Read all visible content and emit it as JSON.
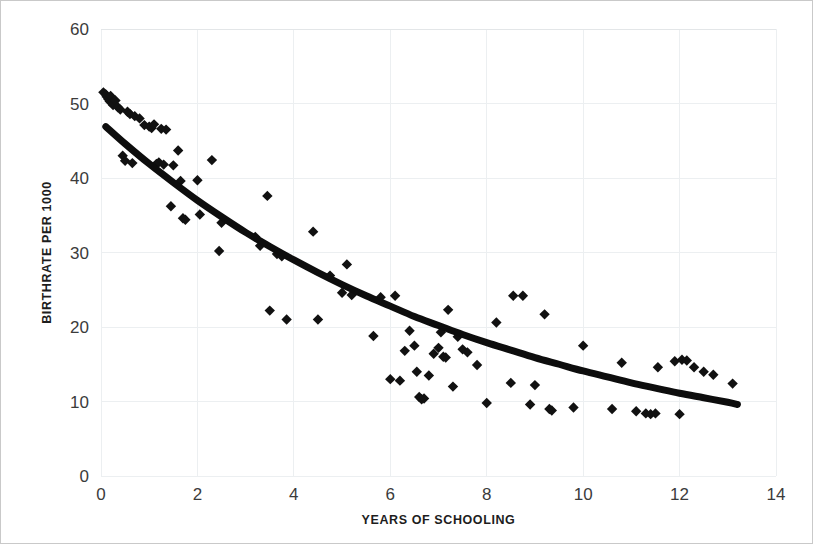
{
  "chart_data": {
    "type": "scatter",
    "title": "",
    "xlabel": "YEARS OF SCHOOLING",
    "ylabel": "BIRTHRATE PER 1000",
    "xlim": [
      0,
      14
    ],
    "ylim": [
      0,
      60
    ],
    "xticks": [
      0,
      2,
      4,
      6,
      8,
      10,
      12,
      14
    ],
    "yticks": [
      0,
      10,
      20,
      30,
      40,
      50,
      60
    ],
    "xtick_labels": [
      "0",
      "2",
      "4",
      "6",
      "8",
      "10",
      "12",
      "14"
    ],
    "ytick_labels": [
      "0",
      "10",
      "20",
      "30",
      "40",
      "50",
      "60"
    ],
    "grid": true,
    "legend": "none",
    "marker_shape": "diamond",
    "marker_color": "#111111",
    "series": [
      {
        "name": "Countries",
        "type": "scatter",
        "points": [
          [
            0.05,
            51.5
          ],
          [
            0.1,
            51.2
          ],
          [
            0.12,
            50.9
          ],
          [
            0.15,
            50.6
          ],
          [
            0.18,
            50.3
          ],
          [
            0.2,
            51.0
          ],
          [
            0.22,
            50.1
          ],
          [
            0.25,
            49.8
          ],
          [
            0.3,
            50.4
          ],
          [
            0.35,
            49.5
          ],
          [
            0.4,
            49.2
          ],
          [
            0.45,
            43.0
          ],
          [
            0.5,
            42.3
          ],
          [
            0.55,
            48.9
          ],
          [
            0.6,
            48.6
          ],
          [
            0.65,
            42.0
          ],
          [
            0.7,
            48.3
          ],
          [
            0.8,
            48.0
          ],
          [
            0.9,
            47.1
          ],
          [
            1.0,
            46.9
          ],
          [
            1.05,
            46.7
          ],
          [
            1.1,
            47.2
          ],
          [
            1.15,
            41.9
          ],
          [
            1.2,
            42.1
          ],
          [
            1.25,
            46.6
          ],
          [
            1.3,
            41.8
          ],
          [
            1.35,
            46.5
          ],
          [
            1.45,
            36.2
          ],
          [
            1.5,
            41.7
          ],
          [
            1.6,
            43.7
          ],
          [
            1.65,
            39.6
          ],
          [
            1.7,
            34.6
          ],
          [
            1.75,
            34.4
          ],
          [
            2.0,
            39.7
          ],
          [
            2.05,
            35.1
          ],
          [
            2.3,
            42.4
          ],
          [
            2.45,
            30.2
          ],
          [
            2.5,
            34.0
          ],
          [
            3.2,
            32.1
          ],
          [
            3.3,
            30.9
          ],
          [
            3.45,
            37.6
          ],
          [
            3.5,
            22.2
          ],
          [
            3.65,
            29.8
          ],
          [
            3.75,
            29.5
          ],
          [
            3.85,
            21.0
          ],
          [
            4.4,
            32.8
          ],
          [
            4.5,
            21.0
          ],
          [
            4.75,
            26.9
          ],
          [
            5.0,
            24.6
          ],
          [
            5.1,
            28.4
          ],
          [
            5.2,
            24.3
          ],
          [
            5.65,
            18.8
          ],
          [
            5.8,
            24.0
          ],
          [
            6.0,
            13.0
          ],
          [
            6.1,
            24.2
          ],
          [
            6.2,
            12.8
          ],
          [
            6.3,
            16.8
          ],
          [
            6.4,
            19.5
          ],
          [
            6.5,
            17.5
          ],
          [
            6.55,
            14.0
          ],
          [
            6.6,
            10.6
          ],
          [
            6.65,
            10.3
          ],
          [
            6.7,
            10.4
          ],
          [
            6.8,
            13.5
          ],
          [
            6.9,
            16.4
          ],
          [
            7.0,
            17.2
          ],
          [
            7.05,
            19.3
          ],
          [
            7.1,
            16.0
          ],
          [
            7.15,
            15.9
          ],
          [
            7.2,
            22.3
          ],
          [
            7.3,
            12.0
          ],
          [
            7.4,
            18.7
          ],
          [
            7.5,
            17.0
          ],
          [
            7.6,
            16.6
          ],
          [
            7.8,
            14.9
          ],
          [
            8.0,
            9.8
          ],
          [
            8.2,
            20.6
          ],
          [
            8.5,
            12.5
          ],
          [
            8.55,
            24.2
          ],
          [
            8.75,
            24.2
          ],
          [
            8.9,
            9.6
          ],
          [
            9.0,
            12.2
          ],
          [
            9.2,
            21.7
          ],
          [
            9.3,
            9.0
          ],
          [
            9.35,
            8.8
          ],
          [
            9.8,
            9.2
          ],
          [
            10.0,
            17.5
          ],
          [
            10.6,
            9.0
          ],
          [
            10.8,
            15.2
          ],
          [
            11.1,
            8.7
          ],
          [
            11.3,
            8.4
          ],
          [
            11.4,
            8.3
          ],
          [
            11.5,
            8.4
          ],
          [
            11.55,
            14.6
          ],
          [
            11.9,
            15.4
          ],
          [
            12.0,
            8.3
          ],
          [
            12.05,
            15.6
          ],
          [
            12.15,
            15.5
          ],
          [
            12.3,
            14.6
          ],
          [
            12.5,
            14.0
          ],
          [
            12.7,
            13.6
          ],
          [
            13.1,
            12.4
          ]
        ]
      },
      {
        "name": "Trendline",
        "type": "line",
        "curve": "exponential-decay",
        "points": [
          [
            0.1,
            46.9
          ],
          [
            0.5,
            44.6
          ],
          [
            1.0,
            41.9
          ],
          [
            1.5,
            39.4
          ],
          [
            2.0,
            37.0
          ],
          [
            2.5,
            34.8
          ],
          [
            3.0,
            32.7
          ],
          [
            3.5,
            30.8
          ],
          [
            4.0,
            29.0
          ],
          [
            4.5,
            27.3
          ],
          [
            5.0,
            25.7
          ],
          [
            5.5,
            24.2
          ],
          [
            6.0,
            22.8
          ],
          [
            6.5,
            21.4
          ],
          [
            7.0,
            20.2
          ],
          [
            7.5,
            19.0
          ],
          [
            8.0,
            17.9
          ],
          [
            8.5,
            16.9
          ],
          [
            9.0,
            15.9
          ],
          [
            9.5,
            15.0
          ],
          [
            10.0,
            14.1
          ],
          [
            10.5,
            13.3
          ],
          [
            11.0,
            12.5
          ],
          [
            11.5,
            11.8
          ],
          [
            12.0,
            11.1
          ],
          [
            12.5,
            10.5
          ],
          [
            13.0,
            9.9
          ],
          [
            13.2,
            9.6
          ]
        ]
      }
    ]
  },
  "figure": {
    "x_axis_title": "YEARS OF SCHOOLING",
    "y_axis_title": "BIRTHRATE PER 1000"
  }
}
